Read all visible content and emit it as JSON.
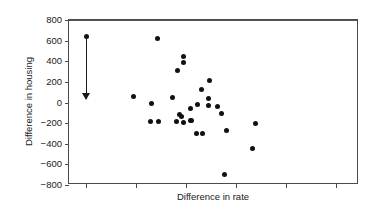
{
  "chart_data": {
    "type": "scatter",
    "title": "",
    "xlabel": "Difference in rate",
    "ylabel": "Difference in housing",
    "ylim": [
      -800,
      800
    ],
    "xlim": [
      0,
      290
    ],
    "ytick_labels": [
      "800",
      "600",
      "400",
      "200",
      "0",
      "−200",
      "−400",
      "−600",
      "−800"
    ],
    "ytick_values": [
      800,
      600,
      400,
      200,
      0,
      -200,
      -400,
      -600,
      -800
    ],
    "xtick_labels": [
      "",
      "",
      "",
      "",
      "",
      ""
    ],
    "xtick_positions": [
      17,
      67,
      117,
      167,
      217,
      267
    ],
    "grid": false,
    "legend": null,
    "zero_line": true,
    "marker_color": "#111111",
    "axis_color": "#4a4a4a",
    "points": [
      {
        "x": 17,
        "y": 640
      },
      {
        "x": 88,
        "y": 620
      },
      {
        "x": 64,
        "y": 60
      },
      {
        "x": 82,
        "y": -5
      },
      {
        "x": 81,
        "y": -185
      },
      {
        "x": 89,
        "y": -185
      },
      {
        "x": 108,
        "y": 310
      },
      {
        "x": 114,
        "y": 450
      },
      {
        "x": 114,
        "y": 385
      },
      {
        "x": 103,
        "y": 50
      },
      {
        "x": 110,
        "y": -120
      },
      {
        "x": 112,
        "y": -140
      },
      {
        "x": 107,
        "y": -185
      },
      {
        "x": 114,
        "y": -190
      },
      {
        "x": 121,
        "y": -60
      },
      {
        "x": 122,
        "y": -175
      },
      {
        "x": 121,
        "y": -175
      },
      {
        "x": 132,
        "y": 130
      },
      {
        "x": 128,
        "y": -15
      },
      {
        "x": 127,
        "y": -305
      },
      {
        "x": 133,
        "y": -305
      },
      {
        "x": 140,
        "y": 215
      },
      {
        "x": 139,
        "y": 35
      },
      {
        "x": 139,
        "y": -25
      },
      {
        "x": 148,
        "y": -35
      },
      {
        "x": 152,
        "y": -105
      },
      {
        "x": 157,
        "y": -270
      },
      {
        "x": 155,
        "y": -700
      },
      {
        "x": 186,
        "y": -200
      },
      {
        "x": 183,
        "y": -450
      }
    ],
    "annotation": {
      "name": "range-arrow",
      "x": 17,
      "y_start": 620,
      "y_end": 35,
      "direction": "down",
      "color": "#1a1a1a"
    }
  }
}
